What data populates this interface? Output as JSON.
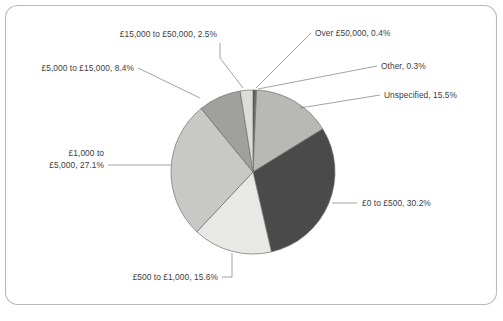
{
  "figure": {
    "frame": {
      "border_color": "#b9b9b7",
      "background": "#ffffff",
      "corner_radius": 12
    },
    "leader_line_color": "#7a7a78",
    "slice_outline_color": "#6e6e6c",
    "label_text_color": "#3d3d3d"
  },
  "chart_data": {
    "type": "pie",
    "title": "",
    "subtitle": "",
    "xlabel": "",
    "ylabel": "",
    "legend_position": "none",
    "grid": false,
    "start_angle_deg": 0,
    "direction": "clockwise",
    "units": "percent",
    "total": 100.0,
    "categories": [
      "Over £50,000",
      "Other",
      "Unspecified",
      "£0 to £500",
      "£500 to £1,000",
      "£1,000 to £5,000",
      "£5,000 to £15,000",
      "£15,000 to £50,000"
    ],
    "values": [
      0.4,
      0.3,
      15.5,
      30.2,
      15.6,
      27.1,
      8.4,
      2.5
    ],
    "colors": [
      "#3a3a3a",
      "#6d6d6b",
      "#b8b8b6",
      "#4a4a4a",
      "#e8e8e6",
      "#c8c8c6",
      "#a0a09e",
      "#dcdcda"
    ],
    "slices": [
      {
        "name": "Over £50,000",
        "value": 0.4,
        "color": "#3a3a3a",
        "label": "Over £50,000, 0.4%"
      },
      {
        "name": "Other",
        "value": 0.3,
        "color": "#6d6d6b",
        "label": "Other, 0.3%"
      },
      {
        "name": "Unspecified",
        "value": 15.5,
        "color": "#b8b8b6",
        "label": "Unspecified, 15.5%"
      },
      {
        "name": "£0 to £500",
        "value": 30.2,
        "color": "#4a4a4a",
        "label": "£0 to £500, 30.2%"
      },
      {
        "name": "£500 to £1,000",
        "value": 15.6,
        "color": "#e8e8e6",
        "label": "£500 to £1,000, 15.6%"
      },
      {
        "name": "£1,000 to £5,000",
        "value": 27.1,
        "color": "#c8c8c6",
        "label_line1": "£1,000 to",
        "label_line2": "£5,000, 27.1%",
        "label": "£1,000 to £5,000, 27.1%"
      },
      {
        "name": "£5,000 to £15,000",
        "value": 8.4,
        "color": "#a0a09e",
        "label": "£5,000 to £15,000, 8.4%"
      },
      {
        "name": "£15,000 to £50,000",
        "value": 2.5,
        "color": "#dcdcda",
        "label": "£15,000 to £50,000, 2.5%"
      }
    ]
  }
}
